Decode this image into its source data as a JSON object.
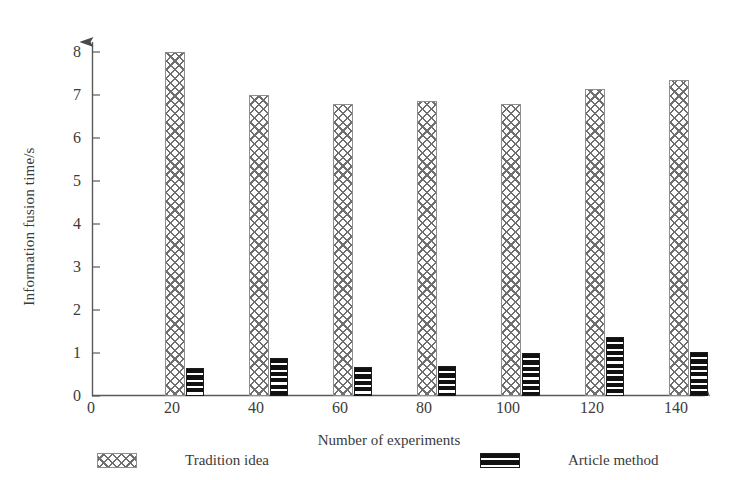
{
  "chart_data": {
    "type": "bar",
    "title": "",
    "xlabel": "Number of experiments",
    "ylabel": "Information fusion time/s",
    "categories": [
      20,
      40,
      60,
      80,
      100,
      120,
      140
    ],
    "x_tick_labels": [
      "0",
      "20",
      "40",
      "60",
      "80",
      "100",
      "120",
      "140"
    ],
    "y_tick_labels": [
      "0",
      "1",
      "2",
      "3",
      "4",
      "5",
      "6",
      "7",
      "8"
    ],
    "xlim": [
      0,
      160
    ],
    "ylim": [
      0,
      8.4
    ],
    "grid": false,
    "legend_position": "below-plot",
    "series": [
      {
        "name": "Tradition idea",
        "pattern": "cross-hatch",
        "color": "#6f6f6f",
        "values": [
          8.0,
          7.0,
          6.8,
          6.85,
          6.8,
          7.15,
          7.35
        ]
      },
      {
        "name": "Article method",
        "pattern": "horizontal-stripes",
        "color": "#111111",
        "values": [
          0.65,
          0.88,
          0.68,
          0.7,
          1.0,
          1.37,
          1.02
        ]
      }
    ]
  },
  "axes": {
    "y_title": "Information fusion time/s",
    "x_title": "Number of experiments",
    "x_origin_label": "0"
  },
  "legend": {
    "items": [
      {
        "label": "Tradition idea"
      },
      {
        "label": "Article method"
      }
    ]
  }
}
